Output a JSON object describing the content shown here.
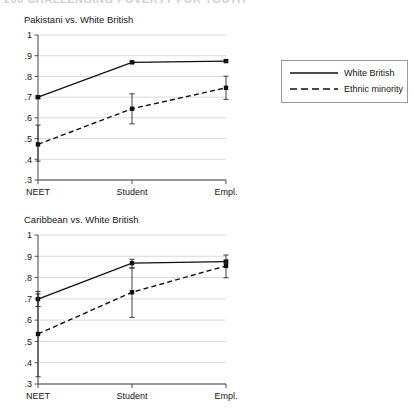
{
  "header": {
    "cut_off_text": "200    CHALLENGING POVERTY FOR YOUTH"
  },
  "legend": {
    "position": "right",
    "items": [
      {
        "label": "White British",
        "style": "solid"
      },
      {
        "label": "Ethnic minority",
        "style": "dashed"
      }
    ]
  },
  "panels": [
    {
      "title": "Pakistani vs. White British"
    },
    {
      "title": "Caribbean vs. White British"
    }
  ],
  "axis": {
    "categories": [
      "NEET",
      "Student",
      "Empl."
    ],
    "yticks": [
      "1",
      ".9",
      ".8",
      ".7",
      ".6",
      ".5",
      ".4",
      ".3"
    ],
    "ytick_values": [
      1,
      0.9,
      0.8,
      0.7,
      0.6,
      0.5,
      0.4,
      0.3
    ],
    "ylim": [
      0.3,
      1.0
    ]
  },
  "chart_data": [
    {
      "type": "line",
      "title": "Pakistani vs. White British",
      "xlabel": "",
      "ylabel": "",
      "categories": [
        "NEET",
        "Student",
        "Empl."
      ],
      "ylim": [
        0.3,
        1.0
      ],
      "yticks": [
        0.3,
        0.4,
        0.5,
        0.6,
        0.7,
        0.8,
        0.9,
        1.0
      ],
      "grid": "horizontal",
      "legend": "right-outside",
      "series": [
        {
          "name": "White British",
          "style": "solid",
          "values": [
            0.7,
            0.868,
            0.874
          ],
          "ci_low": [
            0.693,
            0.862,
            0.869
          ],
          "ci_high": [
            0.707,
            0.874,
            0.879
          ]
        },
        {
          "name": "Ethnic minority",
          "style": "dashed",
          "values": [
            0.472,
            0.644,
            0.745
          ],
          "ci_low": [
            0.391,
            0.571,
            0.689
          ],
          "ci_high": [
            0.565,
            0.716,
            0.801
          ]
        }
      ]
    },
    {
      "type": "line",
      "title": "Caribbean vs. White British",
      "xlabel": "",
      "ylabel": "",
      "categories": [
        "NEET",
        "Student",
        "Empl."
      ],
      "ylim": [
        0.3,
        1.0
      ],
      "yticks": [
        0.3,
        0.4,
        0.5,
        0.6,
        0.7,
        0.8,
        0.9,
        1.0
      ],
      "grid": "horizontal",
      "legend": "right-outside",
      "series": [
        {
          "name": "White British",
          "style": "solid",
          "values": [
            0.699,
            0.868,
            0.875
          ],
          "ci_low": [
            0.664,
            0.845,
            0.869
          ],
          "ci_high": [
            0.735,
            0.886,
            0.881
          ]
        },
        {
          "name": "Ethnic minority",
          "style": "dashed",
          "values": [
            0.535,
            0.731,
            0.855
          ],
          "ci_low": [
            0.334,
            0.613,
            0.799
          ],
          "ci_high": [
            0.723,
            0.845,
            0.906
          ]
        }
      ]
    }
  ]
}
